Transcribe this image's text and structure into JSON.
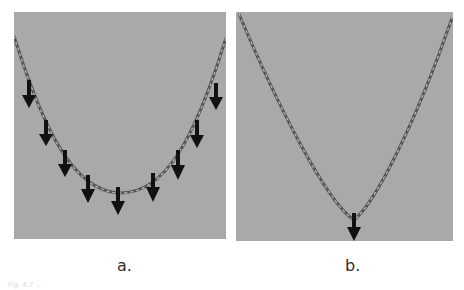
{
  "figure": {
    "panels": [
      {
        "id": "a",
        "label": "a.",
        "description": "Chain hanging in a catenary curve with distributed downward loads",
        "background_color": "#a9a9a9",
        "chain_color": "#4a4a4a",
        "arrow_color": "#111111",
        "arrow_count": 9,
        "load_type": "distributed"
      },
      {
        "id": "b",
        "label": "b.",
        "description": "Chain pulled into a V shape by a single point load",
        "background_color": "#a9a9a9",
        "chain_color": "#4a4a4a",
        "arrow_color": "#111111",
        "arrow_count": 1,
        "load_type": "point"
      }
    ],
    "caption_fragment": "Fig. 4.7 ..."
  }
}
